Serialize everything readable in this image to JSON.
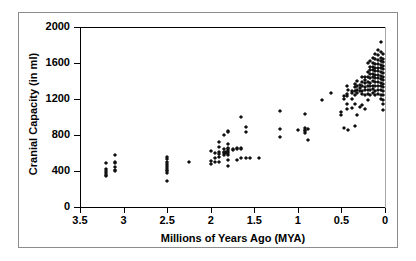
{
  "chart_data": {
    "type": "scatter",
    "title": "",
    "xlabel": "Millions of Years Ago (MYA)",
    "ylabel": "Cranial Capacity (in ml)",
    "xlim": [
      3.5,
      0
    ],
    "ylim": [
      0,
      2000
    ],
    "x_reversed": true,
    "grid": false,
    "legend": "none",
    "xticks": [
      3.5,
      3,
      2.5,
      2,
      1.5,
      1,
      0.5,
      0
    ],
    "xtick_labels": [
      "3.5",
      "3",
      "2.5",
      "2",
      "1.5",
      "1",
      "0.5",
      "0"
    ],
    "yticks": [
      0,
      400,
      800,
      1200,
      1600,
      2000
    ],
    "ytick_labels": [
      "0",
      "400",
      "800",
      "1200",
      "1600",
      "2000"
    ],
    "marker": "diamond",
    "marker_color": "#111111",
    "points": [
      [
        3.2,
        490
      ],
      [
        3.2,
        420
      ],
      [
        3.2,
        400
      ],
      [
        3.2,
        380
      ],
      [
        3.2,
        360
      ],
      [
        3.2,
        340
      ],
      [
        3.1,
        575
      ],
      [
        3.1,
        500
      ],
      [
        3.1,
        490
      ],
      [
        3.1,
        440
      ],
      [
        3.1,
        410
      ],
      [
        3.1,
        395
      ],
      [
        2.5,
        555
      ],
      [
        2.5,
        530
      ],
      [
        2.5,
        500
      ],
      [
        2.5,
        480
      ],
      [
        2.5,
        455
      ],
      [
        2.5,
        430
      ],
      [
        2.5,
        410
      ],
      [
        2.5,
        395
      ],
      [
        2.5,
        375
      ],
      [
        2.5,
        290
      ],
      [
        2.25,
        495
      ],
      [
        2.0,
        625
      ],
      [
        2.0,
        510
      ],
      [
        2.0,
        480
      ],
      [
        1.95,
        600
      ],
      [
        1.95,
        545
      ],
      [
        1.95,
        500
      ],
      [
        1.9,
        720
      ],
      [
        1.9,
        665
      ],
      [
        1.9,
        610
      ],
      [
        1.9,
        590
      ],
      [
        1.9,
        560
      ],
      [
        1.9,
        505
      ],
      [
        1.85,
        805
      ],
      [
        1.85,
        640
      ],
      [
        1.85,
        615
      ],
      [
        1.85,
        600
      ],
      [
        1.85,
        580
      ],
      [
        1.82,
        610
      ],
      [
        1.82,
        595
      ],
      [
        1.8,
        840
      ],
      [
        1.8,
        830
      ],
      [
        1.8,
        700
      ],
      [
        1.8,
        660
      ],
      [
        1.8,
        640
      ],
      [
        1.8,
        620
      ],
      [
        1.8,
        600
      ],
      [
        1.8,
        580
      ],
      [
        1.8,
        520
      ],
      [
        1.8,
        455
      ],
      [
        1.75,
        645
      ],
      [
        1.75,
        630
      ],
      [
        1.7,
        660
      ],
      [
        1.7,
        640
      ],
      [
        1.7,
        520
      ],
      [
        1.65,
        1000
      ],
      [
        1.65,
        660
      ],
      [
        1.65,
        645
      ],
      [
        1.65,
        540
      ],
      [
        1.6,
        890
      ],
      [
        1.6,
        830
      ],
      [
        1.6,
        540
      ],
      [
        1.55,
        545
      ],
      [
        1.45,
        545
      ],
      [
        1.2,
        1070
      ],
      [
        1.2,
        865
      ],
      [
        1.2,
        780
      ],
      [
        1.0,
        860
      ],
      [
        0.92,
        1035
      ],
      [
        0.92,
        880
      ],
      [
        0.92,
        855
      ],
      [
        0.92,
        845
      ],
      [
        0.92,
        825
      ],
      [
        0.88,
        870
      ],
      [
        0.88,
        745
      ],
      [
        0.72,
        1190
      ],
      [
        0.62,
        1270
      ],
      [
        0.5,
        1060
      ],
      [
        0.5,
        1020
      ],
      [
        0.47,
        1230
      ],
      [
        0.47,
        1200
      ],
      [
        0.47,
        880
      ],
      [
        0.44,
        1345
      ],
      [
        0.44,
        1255
      ],
      [
        0.44,
        1230
      ],
      [
        0.44,
        1150
      ],
      [
        0.44,
        1090
      ],
      [
        0.42,
        1300
      ],
      [
        0.42,
        860
      ],
      [
        0.38,
        1285
      ],
      [
        0.38,
        1265
      ],
      [
        0.38,
        1195
      ],
      [
        0.38,
        1100
      ],
      [
        0.35,
        1370
      ],
      [
        0.35,
        1330
      ],
      [
        0.35,
        1290
      ],
      [
        0.35,
        1240
      ],
      [
        0.35,
        1150
      ],
      [
        0.35,
        900
      ],
      [
        0.32,
        1400
      ],
      [
        0.32,
        1345
      ],
      [
        0.32,
        1300
      ],
      [
        0.32,
        1270
      ],
      [
        0.32,
        1020
      ],
      [
        0.29,
        1355
      ],
      [
        0.29,
        1320
      ],
      [
        0.29,
        1290
      ],
      [
        0.29,
        1115
      ],
      [
        0.26,
        1440
      ],
      [
        0.26,
        1390
      ],
      [
        0.26,
        1350
      ],
      [
        0.26,
        1290
      ],
      [
        0.26,
        1255
      ],
      [
        0.26,
        1130
      ],
      [
        0.23,
        1450
      ],
      [
        0.23,
        1410
      ],
      [
        0.23,
        1380
      ],
      [
        0.23,
        1330
      ],
      [
        0.23,
        1300
      ],
      [
        0.23,
        1240
      ],
      [
        0.23,
        1090
      ],
      [
        0.2,
        1600
      ],
      [
        0.2,
        1500
      ],
      [
        0.2,
        1440
      ],
      [
        0.2,
        1390
      ],
      [
        0.2,
        1340
      ],
      [
        0.2,
        1300
      ],
      [
        0.2,
        1260
      ],
      [
        0.2,
        1190
      ],
      [
        0.17,
        1620
      ],
      [
        0.17,
        1560
      ],
      [
        0.17,
        1520
      ],
      [
        0.17,
        1480
      ],
      [
        0.17,
        1430
      ],
      [
        0.17,
        1380
      ],
      [
        0.17,
        1340
      ],
      [
        0.17,
        1300
      ],
      [
        0.17,
        1250
      ],
      [
        0.14,
        1660
      ],
      [
        0.14,
        1600
      ],
      [
        0.14,
        1560
      ],
      [
        0.14,
        1520
      ],
      [
        0.14,
        1480
      ],
      [
        0.14,
        1440
      ],
      [
        0.14,
        1400
      ],
      [
        0.14,
        1350
      ],
      [
        0.14,
        1310
      ],
      [
        0.14,
        1270
      ],
      [
        0.11,
        1700
      ],
      [
        0.11,
        1640
      ],
      [
        0.11,
        1590
      ],
      [
        0.11,
        1550
      ],
      [
        0.11,
        1510
      ],
      [
        0.11,
        1470
      ],
      [
        0.11,
        1430
      ],
      [
        0.11,
        1390
      ],
      [
        0.11,
        1340
      ],
      [
        0.11,
        1290
      ],
      [
        0.11,
        1240
      ],
      [
        0.08,
        1745
      ],
      [
        0.08,
        1690
      ],
      [
        0.08,
        1630
      ],
      [
        0.08,
        1590
      ],
      [
        0.08,
        1550
      ],
      [
        0.08,
        1510
      ],
      [
        0.08,
        1470
      ],
      [
        0.08,
        1430
      ],
      [
        0.08,
        1390
      ],
      [
        0.08,
        1350
      ],
      [
        0.08,
        1300
      ],
      [
        0.08,
        1260
      ],
      [
        0.05,
        1830
      ],
      [
        0.05,
        1720
      ],
      [
        0.05,
        1660
      ],
      [
        0.05,
        1620
      ],
      [
        0.05,
        1580
      ],
      [
        0.05,
        1540
      ],
      [
        0.05,
        1500
      ],
      [
        0.05,
        1460
      ],
      [
        0.05,
        1420
      ],
      [
        0.05,
        1380
      ],
      [
        0.05,
        1340
      ],
      [
        0.05,
        1300
      ],
      [
        0.05,
        1250
      ],
      [
        0.05,
        1200
      ],
      [
        0.02,
        1700
      ],
      [
        0.02,
        1650
      ],
      [
        0.02,
        1610
      ],
      [
        0.02,
        1570
      ],
      [
        0.02,
        1530
      ],
      [
        0.02,
        1490
      ],
      [
        0.02,
        1450
      ],
      [
        0.02,
        1410
      ],
      [
        0.02,
        1370
      ],
      [
        0.02,
        1330
      ],
      [
        0.02,
        1290
      ],
      [
        0.02,
        1240
      ],
      [
        0.02,
        1190
      ],
      [
        0.02,
        1140
      ],
      [
        0.02,
        1080
      ]
    ]
  },
  "axes": {
    "xlabel": "Millions of Years Ago (MYA)",
    "ylabel": "Cranial Capacity (in ml)"
  }
}
